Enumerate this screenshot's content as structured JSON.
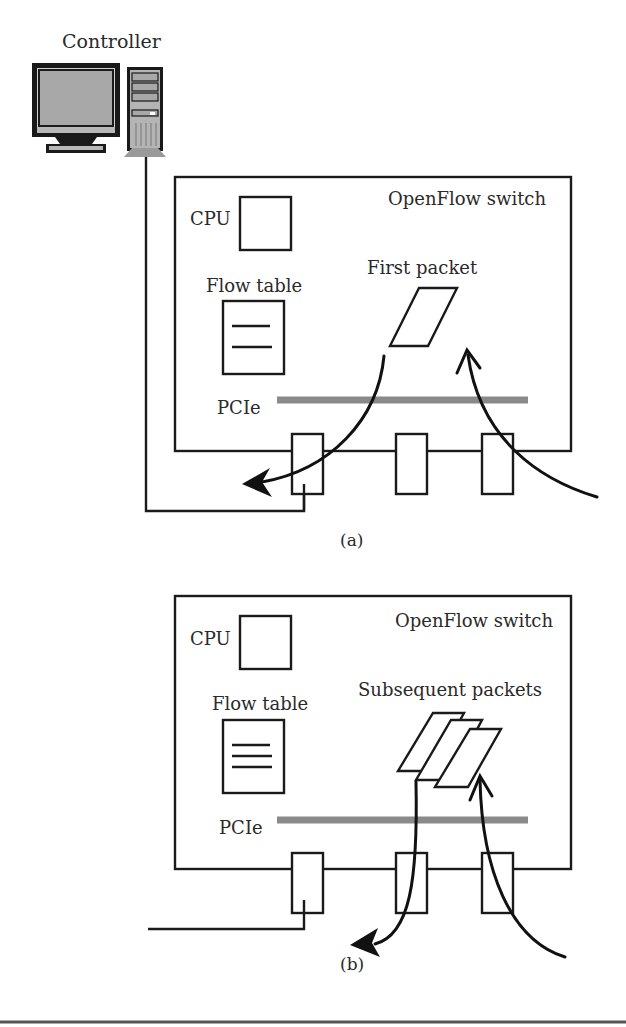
{
  "controller": {
    "label": "Controller"
  },
  "panel_a": {
    "caption": "(a)",
    "switch_label": "OpenFlow switch",
    "cpu_label": "CPU",
    "flow_table_label": "Flow table",
    "bus_label": "PCIe",
    "packet_label": "First packet",
    "flow_table_entries": 2
  },
  "panel_b": {
    "caption": "(b)",
    "switch_label": "OpenFlow switch",
    "cpu_label": "CPU",
    "flow_table_label": "Flow table",
    "bus_label": "PCIe",
    "packet_label": "Subsequent packets",
    "flow_table_entries": 3
  },
  "colors": {
    "line": "#1a1a1a",
    "bus": "#8a8a8a",
    "monitor_screen": "#a8a8a8",
    "tower": "#b4b4b4"
  }
}
